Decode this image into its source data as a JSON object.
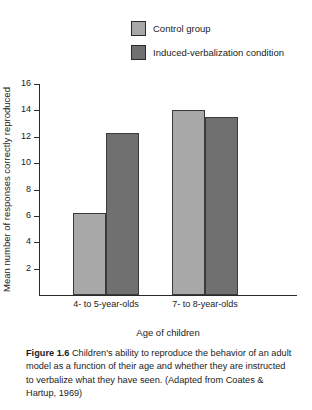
{
  "chart_data": {
    "type": "bar",
    "title": "",
    "categories": [
      "4- to 5-year-olds",
      "7- to 8-year-olds"
    ],
    "series": [
      {
        "name": "Control group",
        "values": [
          6.2,
          14.0
        ],
        "color": "#a8a8a8"
      },
      {
        "name": "Induced-verbalization condition",
        "values": [
          12.3,
          13.5
        ],
        "color": "#707070"
      }
    ],
    "xlabel": "Age of children",
    "ylabel": "Mean number of responses correctly reproduced",
    "ylim": [
      0,
      16
    ],
    "yticks": [
      2,
      4,
      6,
      8,
      10,
      12,
      14,
      16
    ],
    "ytick_labels": [
      "2",
      "4",
      "6",
      "8",
      "10",
      "12",
      "14",
      "16"
    ],
    "grid": false,
    "legend_position": "top-right"
  },
  "legend": {
    "items": [
      {
        "label": "Control group"
      },
      {
        "label": "Induced-verbalization condition"
      }
    ]
  },
  "caption": {
    "figure_number": "Figure 1.6",
    "text": "Children's ability to reproduce the behavior of an adult model as a function of their age and whether they are instructed to verbalize what they have seen. (Adapted from Coates & Hartup, 1969)"
  },
  "colors": {
    "control": "#a8a8a8",
    "induced": "#707070",
    "axis": "#2b2b2b",
    "background": "#ffffff"
  }
}
